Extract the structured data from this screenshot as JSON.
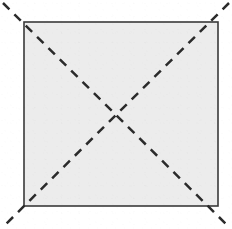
{
  "figure": {
    "kind": "geometric-diagram",
    "canvas": {
      "width": 232,
      "height": 229,
      "background_color": "#ffffff"
    },
    "square": {
      "name": "square",
      "left": 24,
      "top": 22,
      "right": 218,
      "bottom": 206,
      "width": 194,
      "height": 184,
      "fill_color": "#ececec",
      "stroke_color": "#3a3a3a",
      "stroke_width": 1.6,
      "corners": {
        "top_left": [
          24,
          22
        ],
        "top_right": [
          218,
          22
        ],
        "bottom_right": [
          218,
          206
        ],
        "bottom_left": [
          24,
          206
        ]
      }
    },
    "diagonals": {
      "stroke_color": "#2b2b2b",
      "stroke_width": 2.5,
      "dash_length": 9,
      "gap_length": 7,
      "dash_array": "9 7",
      "linecap": "butt",
      "intersection": [
        121,
        114
      ],
      "overhang": 21,
      "lines": [
        {
          "name": "diagonal-top-left-to-bottom-right",
          "x1": 3,
          "y1": 3,
          "x2": 228,
          "y2": 226
        },
        {
          "name": "diagonal-top-right-to-bottom-left",
          "x1": 229,
          "y1": 3,
          "x2": 4,
          "y2": 226
        }
      ]
    }
  }
}
